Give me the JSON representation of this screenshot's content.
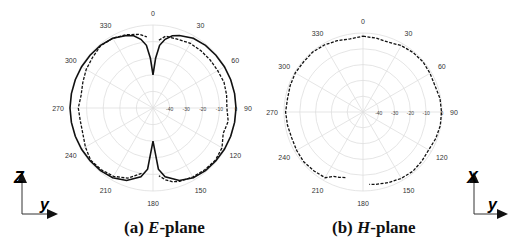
{
  "chart_data": [
    {
      "type": "polar",
      "title": "(a) E-plane",
      "caption": {
        "prefix": "(a) ",
        "italic": "E",
        "suffix": "-plane"
      },
      "center": [
        153,
        108
      ],
      "radius": 83,
      "r_range_db": [
        -50,
        0
      ],
      "radial_ticks": [
        "-40",
        "-30",
        "-20",
        "-10",
        "0"
      ],
      "radial_tick_values": [
        -40,
        -30,
        -20,
        -10,
        0
      ],
      "angle_ticks": [
        "0",
        "30",
        "60",
        "90",
        "120",
        "150",
        "180",
        "210",
        "240",
        "270",
        "300",
        "330"
      ],
      "grid": true,
      "series": [
        {
          "name": "Simulated",
          "style": "solid",
          "angles": [
            0,
            3,
            6,
            10,
            15,
            20,
            30,
            40,
            50,
            60,
            70,
            80,
            90,
            100,
            110,
            120,
            130,
            140,
            150,
            160,
            170,
            175,
            180,
            185,
            190,
            200,
            210,
            220,
            230,
            240,
            250,
            260,
            270,
            280,
            290,
            300,
            310,
            320,
            330,
            340,
            345,
            350,
            354,
            357,
            360
          ],
          "values": [
            -30,
            -20,
            -12,
            -8,
            -5,
            -3.5,
            -1.5,
            -0.8,
            -0.5,
            -0.3,
            -0.2,
            -0.1,
            0,
            -0.1,
            -0.2,
            -0.3,
            -0.5,
            -0.8,
            -1.5,
            -3.5,
            -8,
            -13,
            -30,
            -13,
            -8,
            -3.5,
            -1.5,
            -0.8,
            -0.5,
            -0.3,
            -0.2,
            -0.1,
            0,
            -0.1,
            -0.2,
            -0.3,
            -0.5,
            -0.8,
            -1.5,
            -3.5,
            -5,
            -8,
            -12,
            -20,
            -30
          ]
        },
        {
          "name": "Measured",
          "style": "dashed",
          "angles": [
            5,
            10,
            20,
            30,
            40,
            50,
            60,
            70,
            80,
            90,
            100,
            110,
            120,
            130,
            140,
            150,
            160,
            165,
            170,
            175,
            190,
            200,
            210,
            220,
            230,
            240,
            250,
            260,
            270,
            280,
            290,
            300,
            310,
            320,
            330,
            340,
            350,
            355
          ],
          "values": [
            -9,
            -6,
            -6,
            -5,
            -5,
            -5,
            -5,
            -4.5,
            -5,
            -5.5,
            -4,
            -5,
            -2,
            -1,
            -1.5,
            -2,
            -3,
            -4,
            -6,
            -9,
            -10,
            -5,
            -2.5,
            -1.5,
            -1,
            -3,
            -5,
            -5.5,
            -5,
            -6,
            -5,
            -3.5,
            -2.5,
            -1,
            -1.5,
            -3,
            -5,
            -7
          ]
        }
      ]
    },
    {
      "type": "polar",
      "title": "(b) H-plane",
      "caption": {
        "prefix": "(b) ",
        "italic": "H",
        "suffix": "-plane"
      },
      "center": [
        363,
        112
      ],
      "radius": 79,
      "r_range_db": [
        -50,
        0
      ],
      "radial_ticks": [
        "-40",
        "-30",
        "-20",
        "-10",
        "0"
      ],
      "radial_tick_values": [
        -40,
        -30,
        -20,
        -10,
        0
      ],
      "angle_ticks": [
        "0",
        "30",
        "60",
        "90",
        "120",
        "150",
        "180",
        "210",
        "240",
        "270",
        "300",
        "330"
      ],
      "grid": true,
      "series": [
        {
          "name": "Simulated",
          "style": "solid",
          "angles": [
            0,
            30,
            60,
            90,
            120,
            150,
            180,
            210,
            240,
            270,
            300,
            330,
            360
          ],
          "values": [
            0,
            -0.3,
            -0.5,
            -0.3,
            -0.5,
            -0.3,
            0,
            -0.3,
            -0.5,
            -0.3,
            -0.5,
            -0.3,
            0
          ]
        },
        {
          "name": "Measured",
          "style": "dashed",
          "angles": [
            0,
            10,
            20,
            30,
            40,
            50,
            60,
            70,
            80,
            90,
            100,
            110,
            120,
            130,
            140,
            150,
            160,
            170,
            175,
            195,
            200,
            205,
            210,
            220,
            230,
            240,
            250,
            260,
            270,
            280,
            290,
            300,
            310,
            320,
            330,
            340,
            350,
            360
          ],
          "values": [
            -2,
            -2.5,
            -3,
            -1.5,
            -0.8,
            -0.5,
            -1,
            -1.5,
            -0.5,
            -0.3,
            -0.3,
            -1,
            -2,
            -1.5,
            -1,
            -1.5,
            -2.5,
            -3.5,
            -4,
            -7,
            -6,
            -5,
            -2,
            -1.5,
            -1,
            -1.5,
            -2,
            -1.5,
            -1,
            -1.5,
            -1,
            -0.5,
            -0.8,
            -0.5,
            -1,
            -2,
            -3,
            -2
          ]
        }
      ]
    }
  ],
  "axes_icons": [
    {
      "vertical_label": "Z",
      "horizontal_label": "y"
    },
    {
      "vertical_label": "X",
      "horizontal_label": "y"
    }
  ]
}
